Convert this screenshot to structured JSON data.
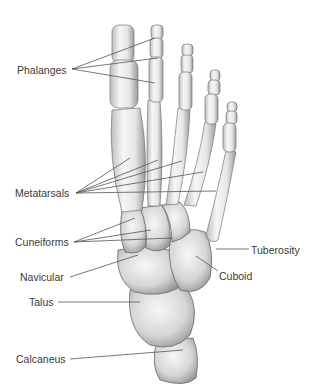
{
  "diagram": {
    "labels": [
      {
        "id": "phalanges",
        "text": "Phalanges",
        "x": 17,
        "y": 64
      },
      {
        "id": "metatarsals",
        "text": "Metatarsals",
        "x": 15,
        "y": 187
      },
      {
        "id": "cuneiforms",
        "text": "Cuneiforms",
        "x": 15,
        "y": 236
      },
      {
        "id": "navicular",
        "text": "Navicular",
        "x": 20,
        "y": 271
      },
      {
        "id": "talus",
        "text": "Talus",
        "x": 29,
        "y": 296
      },
      {
        "id": "calcaneus",
        "text": "Calcaneus",
        "x": 16,
        "y": 353
      },
      {
        "id": "tuberosity",
        "text": "Tuberosity",
        "x": 251,
        "y": 244
      },
      {
        "id": "cuboid",
        "text": "Cuboid",
        "x": 219,
        "y": 270
      }
    ],
    "colors": {
      "background": "#ffffff",
      "bone_light": "#f2f2f2",
      "bone_mid": "#d0d0d0",
      "bone_shadow": "#8a8a8a",
      "leader_line": "#555555",
      "label_text": "#3a3a3a"
    }
  }
}
